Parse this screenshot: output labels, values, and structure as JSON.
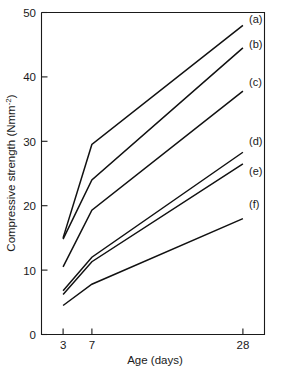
{
  "chart_data": {
    "type": "line",
    "title": "",
    "xlabel": "Age (days)",
    "ylabel": "Compressive strength (Nmm⁻²)",
    "ylabel_base": "Compressive strength (Nmm",
    "ylabel_exponent": "-2",
    "ylabel_close": ")",
    "x": [
      3,
      7,
      28
    ],
    "xticklabels": [
      "3",
      "7",
      "28"
    ],
    "yticks": [
      0,
      10,
      20,
      30,
      40,
      50
    ],
    "yticklabels": [
      "0",
      "10",
      "20",
      "30",
      "40",
      "50"
    ],
    "xlim": [
      0,
      31
    ],
    "ylim": [
      0,
      50
    ],
    "grid": false,
    "legend_position": "right-inline-end-labels",
    "line_color": "#111111",
    "axis_color": "#1a1a1a",
    "background": "#ffffff",
    "series": [
      {
        "name": "(a)",
        "label": "(a)",
        "values": [
          15.0,
          29.5,
          48.0
        ]
      },
      {
        "name": "(b)",
        "label": "(b)",
        "values": [
          14.8,
          24.0,
          44.5
        ]
      },
      {
        "name": "(c)",
        "label": "(c)",
        "values": [
          10.5,
          19.3,
          37.8
        ]
      },
      {
        "name": "(d)",
        "label": "(d)",
        "values": [
          6.8,
          12.0,
          28.3
        ]
      },
      {
        "name": "(e)",
        "label": "(e)",
        "values": [
          6.2,
          11.3,
          26.5
        ]
      },
      {
        "name": "(f)",
        "label": "(f)",
        "values": [
          4.5,
          7.8,
          18.0
        ]
      }
    ]
  },
  "labels": {
    "y_tick_0": "0",
    "y_tick_10": "10",
    "y_tick_20": "20",
    "y_tick_30": "30",
    "y_tick_40": "40",
    "y_tick_50": "50",
    "x_tick_3": "3",
    "x_tick_7": "7",
    "x_tick_28": "28",
    "series_a": "(a)",
    "series_b": "(b)",
    "series_c": "(c)",
    "series_d": "(d)",
    "series_e": "(e)",
    "series_f": "(f)",
    "x_axis_title": "Age (days)",
    "y_axis_title_base": "Compressive strength (Nmm",
    "y_axis_title_sup": "-2",
    "y_axis_title_close": ")"
  }
}
